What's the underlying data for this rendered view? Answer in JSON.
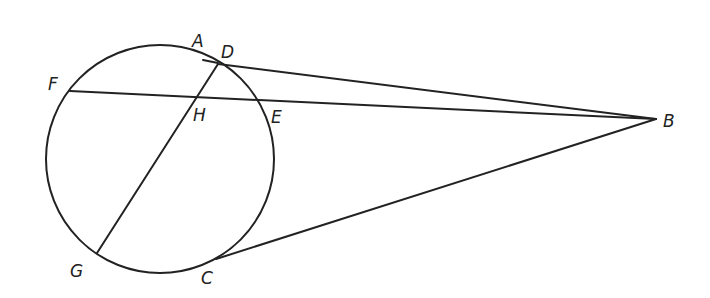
{
  "diagram": {
    "type": "geometry",
    "stroke_color": "#222222",
    "circle": {
      "cx": 160,
      "cy": 159,
      "r": 114
    },
    "points": {
      "A": {
        "label": "A",
        "x": 203,
        "y": 60,
        "label_x": 192,
        "label_y": 47
      },
      "D": {
        "label": "D",
        "x": 218,
        "y": 64,
        "label_x": 221,
        "label_y": 58
      },
      "F": {
        "label": "F",
        "x": 70,
        "y": 91,
        "label_x": 48,
        "label_y": 90
      },
      "H": {
        "label": "H",
        "x": 195,
        "y": 97,
        "label_x": 193,
        "label_y": 121
      },
      "E": {
        "label": "E",
        "x": 257,
        "y": 100,
        "label_x": 271,
        "label_y": 123
      },
      "B": {
        "label": "B",
        "x": 656,
        "y": 119,
        "label_x": 663,
        "label_y": 127
      },
      "G": {
        "label": "G",
        "x": 97,
        "y": 253,
        "label_x": 70,
        "label_y": 277
      },
      "C": {
        "label": "C",
        "x": 216,
        "y": 259,
        "label_x": 201,
        "label_y": 284
      }
    },
    "segments": [
      {
        "name": "secant-fb",
        "from": "F",
        "to": "B"
      },
      {
        "name": "chord-dg",
        "from": "D",
        "to": "G"
      },
      {
        "name": "segment-db",
        "from": "D",
        "to": "B"
      },
      {
        "name": "tangent-cb",
        "from": "C",
        "to": "B"
      }
    ]
  }
}
